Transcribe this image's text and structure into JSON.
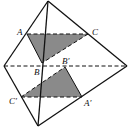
{
  "diagram": {
    "labels": {
      "A": "A",
      "C": "C",
      "B": "B",
      "B_prime": "B′",
      "C_prime": "C′",
      "A_prime": "A′"
    },
    "colors": {
      "edge": "#111111",
      "shade": "#8a8a8a",
      "background": "#ffffff"
    }
  }
}
